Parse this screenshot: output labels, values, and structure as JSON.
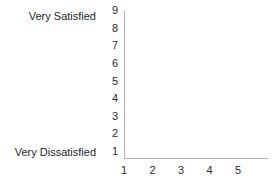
{
  "chart_data": {
    "type": "scatter",
    "title": "",
    "subtitle": "",
    "xlabel": "",
    "ylabel": "",
    "x": [],
    "values": [],
    "series": [],
    "categories": [],
    "xticks": [
      "1",
      "2",
      "3",
      "4",
      "5"
    ],
    "yticks": [
      "9",
      "8",
      "7",
      "6",
      "5",
      "4",
      "3",
      "2",
      "1"
    ],
    "xlim": [
      1,
      5
    ],
    "ylim": [
      1,
      9
    ],
    "grid": false,
    "legend": null,
    "annotations": [
      {
        "text": "Very Satisfied",
        "anchor_y": "9"
      },
      {
        "text": "Very Dissatisfied",
        "anchor_y": "1"
      }
    ],
    "axis_color": "#b3b3b3",
    "text_color": "#2b2b2b",
    "background": "#ffffff",
    "note": "empty plot area with no plotted data"
  },
  "scale": {
    "high_label": "Very Satisfied",
    "low_label": "Very Dissatisfied"
  }
}
